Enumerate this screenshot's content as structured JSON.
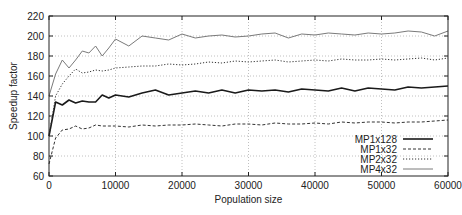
{
  "chart_data": {
    "type": "line",
    "title": "",
    "xlabel": "Population size",
    "ylabel": "Speedup factor",
    "xlim": [
      0,
      60000
    ],
    "ylim": [
      60,
      220
    ],
    "xticks": [
      0,
      10000,
      20000,
      30000,
      40000,
      50000,
      60000
    ],
    "yticks": [
      60,
      80,
      100,
      120,
      140,
      160,
      180,
      200,
      220
    ],
    "grid": true,
    "legend_position": "lower right",
    "x": [
      0,
      1000,
      2000,
      3000,
      4000,
      5000,
      6000,
      7000,
      8000,
      9000,
      10000,
      12000,
      14000,
      16000,
      18000,
      20000,
      22000,
      24000,
      26000,
      28000,
      30000,
      32000,
      34000,
      36000,
      38000,
      40000,
      42000,
      44000,
      46000,
      48000,
      50000,
      52000,
      54000,
      56000,
      58000,
      60000
    ],
    "series": [
      {
        "name": "MP1x128",
        "style": "thick-solid",
        "values": [
          100,
          134,
          131,
          136,
          133,
          135,
          134,
          134,
          141,
          138,
          141,
          139,
          143,
          146,
          141,
          143,
          145,
          143,
          146,
          143,
          146,
          145,
          146,
          144,
          147,
          146,
          145,
          148,
          145,
          148,
          147,
          146,
          149,
          148,
          149,
          150
        ]
      },
      {
        "name": "MP1x32",
        "style": "dashed",
        "values": [
          72,
          98,
          106,
          107,
          110,
          107,
          108,
          111,
          110,
          110,
          110,
          109,
          111,
          110,
          111,
          111,
          112,
          111,
          110,
          112,
          112,
          111,
          113,
          112,
          112,
          113,
          112,
          114,
          113,
          114,
          114,
          113,
          114,
          114,
          115,
          116
        ]
      },
      {
        "name": "MP2x32",
        "style": "dotted",
        "values": [
          100,
          140,
          152,
          160,
          167,
          163,
          164,
          166,
          165,
          166,
          168,
          169,
          170,
          170,
          172,
          171,
          172,
          174,
          173,
          175,
          174,
          175,
          176,
          174,
          175,
          176,
          175,
          177,
          176,
          176,
          177,
          176,
          177,
          178,
          176,
          178
        ]
      },
      {
        "name": "MP4x32",
        "style": "thin-solid-gray",
        "values": [
          140,
          162,
          176,
          168,
          176,
          185,
          183,
          190,
          180,
          188,
          197,
          190,
          200,
          198,
          196,
          202,
          198,
          200,
          201,
          199,
          200,
          202,
          203,
          198,
          202,
          201,
          203,
          202,
          201,
          203,
          202,
          203,
          205,
          204,
          200,
          205
        ]
      }
    ]
  },
  "legend": {
    "items": [
      {
        "label": "MP1x128"
      },
      {
        "label": "MP1x32"
      },
      {
        "label": "MP2x32"
      },
      {
        "label": "MP4x32"
      }
    ]
  },
  "axes": {
    "xlabel": "Population size",
    "ylabel": "Speedup factor",
    "xtick_labels": [
      "0",
      "10000",
      "20000",
      "30000",
      "40000",
      "50000",
      "60000"
    ],
    "ytick_labels": [
      "60",
      "80",
      "100",
      "120",
      "140",
      "160",
      "180",
      "200",
      "220"
    ]
  },
  "colors": {
    "axis": "#222222",
    "grid": "#b0b0b0",
    "MP1x128": "#1a1a1a",
    "MP1x32": "#333333",
    "MP2x32": "#333333",
    "MP4x32": "#7a7a7a"
  }
}
